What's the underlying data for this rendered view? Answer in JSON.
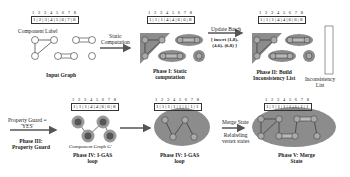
{
  "index_labels": [
    "1",
    "2",
    "3",
    "4",
    "5",
    "6",
    "7",
    "8"
  ],
  "arrays": {
    "input": [
      "1",
      "2",
      "3",
      "4",
      "5",
      "6",
      "7",
      "8"
    ],
    "phase1": [
      "1",
      "1",
      "1",
      "4",
      "4",
      "6",
      "6",
      "8"
    ],
    "phase2": [
      "1",
      "1",
      "1",
      "4",
      "4",
      "6",
      "6",
      "8"
    ],
    "phase4a": [
      "1",
      "1",
      "1",
      "4",
      "4",
      "6",
      "6",
      "8"
    ],
    "phase4b": [
      "1",
      "1",
      "1",
      "1",
      "1",
      "1",
      "1",
      "1"
    ],
    "phase5": [
      "1",
      "1",
      "1",
      "1",
      "1",
      "1",
      "1",
      "1"
    ]
  },
  "labels": {
    "component_label": "Component Label",
    "input_graph": "Input Graph",
    "static_computation_arrow": "Static\nComputation",
    "phase1": "Phase I: Static\ncomputation",
    "update_batch": "Update Batch",
    "update_batch_items": "[ insert (1,8),\n(4,6), (6,8) ]",
    "phase2": "Phase II: Build\nInconsistency List",
    "inconsistency_list": "Inconsistency\nList",
    "inconsistency_values": [
      "1",
      "4",
      "4",
      "6",
      "6",
      "8",
      "6",
      "8",
      "8"
    ],
    "property_guard": "Property Guard =\n'YES'",
    "phase3": "Phase III:\nProperty Guard",
    "component_graph": "Component Graph G'",
    "phase4a": "Phase IV: I-GAS\nloop",
    "phase4b": "Phase IV: I-GAS\nloop",
    "merge_state": "Merge State",
    "relabeling": "Relabeling\nvertex states",
    "phase5": "Phase V: Merge\nState"
  },
  "colors": {
    "region_fill": "#8c8c8c",
    "node_fill": "#ffffff",
    "line": "#333333"
  }
}
